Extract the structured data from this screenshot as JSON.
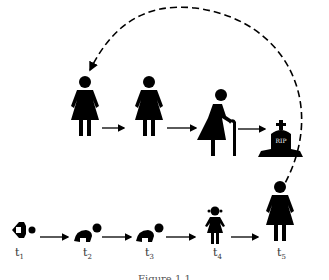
{
  "figure": {
    "caption": "Figure 1.1",
    "colors": {
      "ink": "#000000",
      "background": "#ffffff",
      "label": "#333333"
    }
  },
  "top_row": {
    "stages": [
      {
        "id": "adult-1",
        "icon": "woman-icon"
      },
      {
        "id": "adult-2",
        "icon": "woman-icon"
      },
      {
        "id": "elderly",
        "icon": "elderly-woman-with-cane-icon"
      },
      {
        "id": "death",
        "icon": "tombstone-icon",
        "text": "RIP"
      }
    ]
  },
  "bottom_row": {
    "stages": [
      {
        "id": "newborn",
        "icon": "swaddled-baby-icon",
        "label": "t",
        "sub": "1"
      },
      {
        "id": "infant",
        "icon": "crawling-baby-icon",
        "label": "t",
        "sub": "2"
      },
      {
        "id": "toddler",
        "icon": "crawling-baby-icon",
        "label": "t",
        "sub": "3"
      },
      {
        "id": "child",
        "icon": "girl-icon",
        "label": "t",
        "sub": "4"
      },
      {
        "id": "adult",
        "icon": "woman-icon",
        "label": "t",
        "sub": "5"
      }
    ]
  },
  "cycle_arrow": {
    "style": "dashed",
    "from": "t5",
    "to": "adult-1"
  }
}
